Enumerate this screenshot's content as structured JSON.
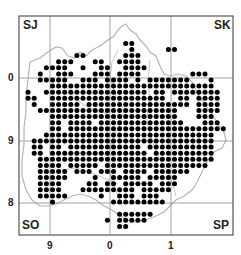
{
  "map": {
    "title": "",
    "frame": {
      "x": 19,
      "y": 16,
      "w": 214,
      "h": 219
    },
    "pitch": 6.1,
    "colors": {
      "frame": "#555555",
      "grid": "#999999",
      "boundary": "#b5b5b5",
      "dot": "#000000"
    },
    "square_labels": [
      {
        "text": "SJ",
        "x": 23,
        "y": 18
      },
      {
        "text": "SK",
        "x": 214,
        "y": 18
      },
      {
        "text": "SO",
        "x": 22,
        "y": 218
      },
      {
        "text": "SP",
        "x": 213,
        "y": 218
      }
    ],
    "x_ticks": [
      {
        "label": "9",
        "x": 50
      },
      {
        "label": "0",
        "x": 110
      },
      {
        "label": "1",
        "x": 171
      }
    ],
    "y_ticks": [
      {
        "label": "0",
        "y": 78
      },
      {
        "label": "9",
        "y": 141
      },
      {
        "label": "8",
        "y": 203
      }
    ],
    "vlines": [
      50,
      110,
      171
    ],
    "hlines": [
      78,
      141,
      203
    ],
    "dot_rows": [
      [],
      [],
      [],
      [],
      [
        17,
        18
      ],
      [
        18,
        24,
        25
      ],
      [
        9,
        10,
        17,
        18,
        19
      ],
      [
        6,
        7,
        8,
        12,
        13,
        16,
        17,
        18,
        19
      ],
      [
        4,
        5,
        6,
        7,
        10,
        13,
        14,
        17,
        18,
        19,
        20
      ],
      [
        3,
        6,
        7,
        8,
        12,
        13,
        14,
        16,
        17,
        18,
        19,
        28,
        29,
        30
      ],
      [
        3,
        4,
        5,
        6,
        7,
        10,
        11,
        12,
        14,
        15,
        16,
        17,
        19,
        21,
        22,
        23,
        24,
        25,
        26,
        27,
        31
      ],
      [
        5,
        6,
        7,
        8,
        9,
        10,
        11,
        12,
        13,
        14,
        15,
        16,
        17,
        18,
        19,
        20,
        21,
        22,
        23,
        24,
        25,
        26,
        27,
        28,
        29,
        30,
        31
      ],
      [
        1,
        4,
        5,
        6,
        7,
        8,
        9,
        10,
        11,
        12,
        13,
        14,
        15,
        16,
        17,
        18,
        19,
        20,
        22,
        23,
        25,
        26,
        27,
        28,
        29,
        30,
        31,
        32
      ],
      [
        1,
        2,
        5,
        6,
        7,
        8,
        9,
        10,
        11,
        12,
        13,
        14,
        15,
        16,
        17,
        18,
        19,
        20,
        21,
        22,
        23,
        26,
        27,
        29,
        30,
        31,
        32
      ],
      [
        2,
        5,
        6,
        7,
        8,
        9,
        11,
        12,
        13,
        14,
        15,
        16,
        17,
        18,
        19,
        20,
        21,
        22,
        23,
        24,
        25,
        26,
        27,
        29,
        30,
        31,
        32
      ],
      [
        3,
        4,
        5,
        6,
        7,
        8,
        9,
        10,
        11,
        12,
        13,
        14,
        15,
        16,
        17,
        18,
        19,
        20,
        21,
        22,
        23,
        24,
        25,
        29,
        30,
        31,
        32
      ],
      [
        5,
        6,
        7,
        8,
        9,
        10,
        11,
        12,
        13,
        14,
        15,
        16,
        17,
        18,
        19,
        20,
        21,
        22,
        23,
        24,
        25,
        29,
        30,
        31
      ],
      [
        5,
        6,
        8,
        9,
        10,
        11,
        13,
        14,
        15,
        16,
        17,
        18,
        19,
        20,
        21,
        22,
        23,
        24,
        25,
        26,
        30,
        31,
        32
      ],
      [
        5,
        6,
        8,
        9,
        10,
        11,
        12,
        13,
        14,
        15,
        16,
        17,
        18,
        19,
        20,
        21,
        22,
        23,
        24,
        25,
        26,
        27,
        28,
        29,
        30,
        31,
        32,
        33
      ],
      [
        4,
        5,
        6,
        7,
        8,
        9,
        10,
        11,
        12,
        13,
        14,
        15,
        16,
        17,
        18,
        19,
        20,
        21,
        22,
        23,
        24,
        25,
        26,
        27,
        28,
        29,
        30,
        31
      ],
      [
        2,
        3,
        4,
        5,
        6,
        7,
        8,
        9,
        10,
        11,
        12,
        13,
        14,
        15,
        16,
        17,
        18,
        19,
        20,
        21,
        22,
        23,
        24,
        25,
        26,
        27,
        28,
        29,
        30,
        31
      ],
      [
        2,
        3,
        5,
        6,
        8,
        9,
        10,
        11,
        12,
        13,
        14,
        15,
        16,
        17,
        18,
        19,
        21,
        22,
        23,
        24,
        25,
        26,
        27,
        28,
        29,
        30,
        31
      ],
      [
        2,
        3,
        5,
        6,
        7,
        8,
        9,
        10,
        11,
        12,
        13,
        14,
        15,
        16,
        17,
        18,
        19,
        20,
        22,
        23,
        24,
        25,
        26,
        27,
        28,
        29,
        30,
        31
      ],
      [
        3,
        4,
        5,
        6,
        7,
        8,
        9,
        10,
        11,
        12,
        13,
        14,
        15,
        16,
        17,
        18,
        19,
        20,
        21,
        22,
        23,
        24,
        25,
        26,
        27,
        28,
        29,
        30,
        31
      ],
      [
        3,
        4,
        5,
        6,
        8,
        9,
        10,
        11,
        12,
        14,
        15,
        16,
        17,
        18,
        19,
        20,
        21,
        22,
        23,
        24,
        25,
        26,
        27,
        28,
        29,
        30
      ],
      [
        3,
        4,
        5,
        6,
        7,
        9,
        10,
        11,
        13,
        14,
        15,
        17,
        18,
        19,
        20,
        22,
        23,
        24,
        25,
        26,
        27
      ],
      [
        3,
        4,
        5,
        6,
        7,
        12,
        15,
        16,
        17,
        18,
        19,
        21,
        22,
        23,
        24,
        25
      ],
      [
        3,
        4,
        5,
        6,
        11,
        12,
        14,
        15,
        17,
        18,
        19,
        20,
        21,
        23,
        24,
        25
      ],
      [
        3,
        4,
        5,
        6,
        10,
        11,
        12,
        13,
        14,
        15,
        16,
        17,
        18,
        20,
        21,
        22,
        23,
        24
      ],
      [
        3,
        4,
        5,
        6,
        7,
        13,
        16,
        17,
        18,
        20,
        21,
        22
      ],
      [
        5,
        15,
        16,
        17,
        18,
        19,
        20,
        21,
        22,
        23
      ],
      [],
      [
        16,
        17,
        18,
        19,
        20,
        21
      ],
      [
        14,
        16,
        17,
        18,
        19,
        20
      ],
      [
        16,
        17
      ],
      []
    ],
    "boundary_path": "M30 62 L40 58 L48 52 L56 47 L62 48 L68 56 L74 58 L80 52 L86 56 L92 50 L100 46 L108 40 L114 36 L118 30 L122 26 L126 24 L130 30 L136 34 L140 40 L146 46 L150 52 L156 56 L160 66 L164 74 L170 76 L178 74 L186 76 L192 82 L196 90 L200 98 L206 106 L212 114 L218 124 L224 132 L226 140 L222 148 L214 152 L208 160 L204 168 L200 176 L196 184 L192 190 L184 196 L176 200 L170 206 L164 212 L156 216 L146 220 L136 222 L126 220 L118 214 L112 210 L104 206 L96 200 L88 196 L80 194 L72 196 L64 200 L56 204 L48 206 L40 206 L32 200 L26 190 L22 176 L22 160 L24 144 L24 128 L26 112 L26 96 L28 80 L30 62 Z",
    "inner_paths": [
      "M118 50 L112 62 L110 78 L116 96 L124 110 L120 124 L112 140 L108 160 L112 180 L118 196 L122 206",
      "M60 78 L70 92 L82 104 L96 110 L108 114",
      "M150 60 L148 80 L150 100 L146 120 L152 140 L160 160 L170 176 L176 196",
      "M60 170 L76 168 L90 172 L104 178 L118 184"
    ]
  }
}
